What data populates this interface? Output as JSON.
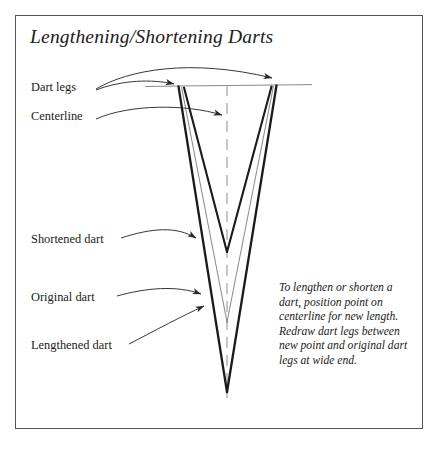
{
  "page": {
    "background_color": "#ffffff",
    "frame_border_color": "#555555"
  },
  "title": "Lengthening/Shortening Darts",
  "labels": {
    "dart_legs": "Dart legs",
    "centerline": "Centerline",
    "shortened_dart": "Shortened dart",
    "original_dart": "Original dart",
    "lengthened_dart": "Lengthened dart"
  },
  "caption": {
    "lines": [
      "To lengthen or shorten a",
      "dart, position point on",
      "centerline for new length.",
      "Redraw dart legs between",
      "new point and original dart",
      "legs at wide end."
    ]
  },
  "diagram": {
    "colors": {
      "dart_line": "#1b1b1b",
      "original_dart_line": "#8a8a8a",
      "centerline": "#9a9a9a",
      "waistline": "#8a8a8a",
      "leader_line": "#2b2b2b"
    },
    "geometry": {
      "wide_end_y": 85,
      "left_leg_top_x": 178,
      "right_leg_top_x": 277,
      "centerline_x": 227,
      "waistline_start_x": 145,
      "waistline_end_x": 312,
      "centerline_bottom_y": 398,
      "apex_shortened": {
        "x": 227,
        "y": 252
      },
      "apex_original": {
        "x": 227,
        "y": 322
      },
      "apex_lengthened": {
        "x": 227,
        "y": 392
      }
    },
    "elements": [
      {
        "name": "shortened-dart",
        "kind": "v-shape",
        "stroke": "#1b1b1b",
        "width": 2.2
      },
      {
        "name": "original-dart",
        "kind": "v-shape",
        "stroke": "#8a8a8a",
        "width": 1.0
      },
      {
        "name": "lengthened-dart",
        "kind": "v-shape",
        "stroke": "#1b1b1b",
        "width": 2.2
      },
      {
        "name": "centerline",
        "kind": "dashed-vertical",
        "stroke": "#9a9a9a",
        "width": 1.0
      },
      {
        "name": "waistline",
        "kind": "horizontal",
        "stroke": "#8a8a8a",
        "width": 1.0
      }
    ]
  }
}
